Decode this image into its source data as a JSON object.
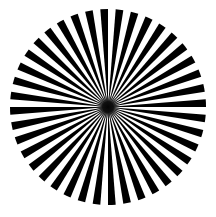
{
  "image": {
    "title": "Radial starburst pattern",
    "width": 216,
    "height": 217,
    "background_color": "#ffffff",
    "alt_text": "Black and white radial sunburst of alternating wedges forming a circle"
  },
  "figure": {
    "name": "starburst-wheel",
    "center_x": 108,
    "center_y": 107,
    "radius": 98,
    "ray_count": 40,
    "segment_count": 80,
    "angular_period_deg": 9,
    "wedge_fill": "#000000",
    "gap_fill": "#ffffff",
    "start_angle_deg": -4.5,
    "hub": {
      "name": "center-hub",
      "radius": 7.5,
      "color": "#0a0a0a",
      "blur_radius": 12
    }
  },
  "chart_data": {
    "type": "pie",
    "title": "Radial starburst pattern",
    "categories": [
      "ray-1",
      "gap-1",
      "ray-2",
      "gap-2",
      "ray-3",
      "gap-3",
      "ray-4",
      "gap-4",
      "ray-5",
      "gap-5",
      "ray-6",
      "gap-6",
      "ray-7",
      "gap-7",
      "ray-8",
      "gap-8",
      "ray-9",
      "gap-9",
      "ray-10",
      "gap-10",
      "ray-11",
      "gap-11",
      "ray-12",
      "gap-12",
      "ray-13",
      "gap-13",
      "ray-14",
      "gap-14",
      "ray-15",
      "gap-15",
      "ray-16",
      "gap-16",
      "ray-17",
      "gap-17",
      "ray-18",
      "gap-18",
      "ray-19",
      "gap-19",
      "ray-20",
      "gap-20",
      "ray-21",
      "gap-21",
      "ray-22",
      "gap-22",
      "ray-23",
      "gap-23",
      "ray-24",
      "gap-24",
      "ray-25",
      "gap-25",
      "ray-26",
      "gap-26",
      "ray-27",
      "gap-27",
      "ray-28",
      "gap-28",
      "ray-29",
      "gap-29",
      "ray-30",
      "gap-30",
      "ray-31",
      "gap-31",
      "ray-32",
      "gap-32",
      "ray-33",
      "gap-33",
      "ray-34",
      "gap-34",
      "ray-35",
      "gap-35",
      "ray-36",
      "gap-36",
      "ray-37",
      "gap-37",
      "ray-38",
      "gap-38",
      "ray-39",
      "gap-39",
      "ray-40",
      "gap-40"
    ],
    "values": [
      4.5,
      4.5,
      4.5,
      4.5,
      4.5,
      4.5,
      4.5,
      4.5,
      4.5,
      4.5,
      4.5,
      4.5,
      4.5,
      4.5,
      4.5,
      4.5,
      4.5,
      4.5,
      4.5,
      4.5,
      4.5,
      4.5,
      4.5,
      4.5,
      4.5,
      4.5,
      4.5,
      4.5,
      4.5,
      4.5,
      4.5,
      4.5,
      4.5,
      4.5,
      4.5,
      4.5,
      4.5,
      4.5,
      4.5,
      4.5,
      4.5,
      4.5,
      4.5,
      4.5,
      4.5,
      4.5,
      4.5,
      4.5,
      4.5,
      4.5,
      4.5,
      4.5,
      4.5,
      4.5,
      4.5,
      4.5,
      4.5,
      4.5,
      4.5,
      4.5,
      4.5,
      4.5,
      4.5,
      4.5,
      4.5,
      4.5,
      4.5,
      4.5,
      4.5,
      4.5,
      4.5,
      4.5,
      4.5,
      4.5,
      4.5,
      4.5,
      4.5,
      4.5,
      4.5,
      4.5
    ],
    "colors": [
      "#000000",
      "#ffffff"
    ],
    "xlabel": "",
    "ylabel": "",
    "legend": [],
    "grid": false,
    "units": "degrees"
  }
}
